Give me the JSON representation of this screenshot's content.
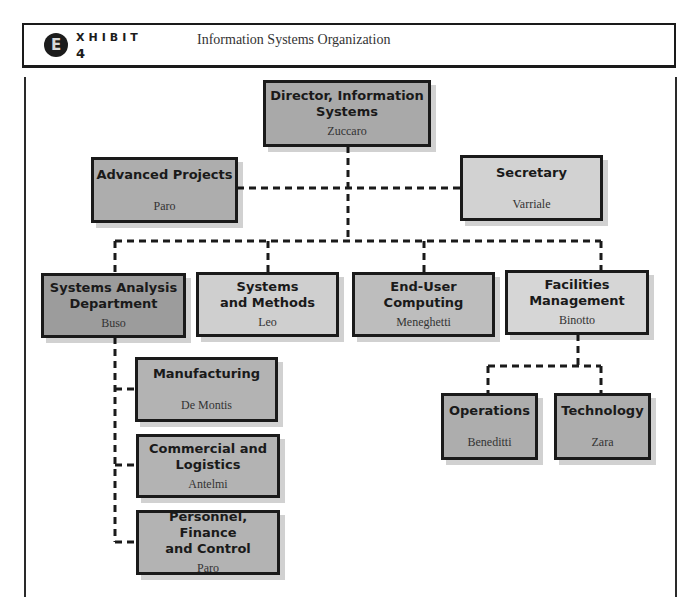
{
  "header": {
    "badge_letter": "E",
    "exhibit_word": "XHIBIT",
    "exhibit_number": "4",
    "title": "Information Systems Organization"
  },
  "org_chart": {
    "director": {
      "title": "Director, Information Systems",
      "title_line1": "Director, Information",
      "title_line2": "Systems",
      "person": "Zuccaro"
    },
    "staff": [
      {
        "title": "Advanced Projects",
        "person": "Paro"
      },
      {
        "title": "Secretary",
        "person": "Varriale"
      }
    ],
    "departments": [
      {
        "title": "Systems Analysis Department",
        "title_line1": "Systems Analysis",
        "title_line2": "Department",
        "person": "Buso"
      },
      {
        "title": "Systems and Methods",
        "title_line1": "Systems",
        "title_line2": "and Methods",
        "person": "Leo"
      },
      {
        "title": "End-User Computing",
        "title_line1": "End-User",
        "title_line2": "Computing",
        "person": "Meneghetti"
      },
      {
        "title": "Facilities Management",
        "title_line1": "Facilities",
        "title_line2": "Management",
        "person": "Binotto"
      }
    ],
    "systems_analysis_units": [
      {
        "title": "Manufacturing",
        "person": "De Montis"
      },
      {
        "title": "Commercial and Logistics",
        "title_line1": "Commercial and",
        "title_line2": "Logistics",
        "person": "Antelmi"
      },
      {
        "title": "Personnel, Finance and Control",
        "title_line1": "Personnel, Finance",
        "title_line2": "and Control",
        "person": "Paro"
      }
    ],
    "facilities_units": [
      {
        "title": "Operations",
        "person": "Beneditti"
      },
      {
        "title": "Technology",
        "person": "Zara"
      }
    ]
  },
  "colors": {
    "border": "#1a1a1a",
    "director_fill": "#a9a9a9",
    "advanced_fill": "#adadad",
    "secretary_fill": "#d2d2d2",
    "systems_analysis_fill": "#9c9c9c",
    "systems_methods_fill": "#cfcfcf",
    "end_user_fill": "#bdbdbd",
    "facilities_fill": "#d6d6d6",
    "unit_fill": "#b3b3b3"
  }
}
